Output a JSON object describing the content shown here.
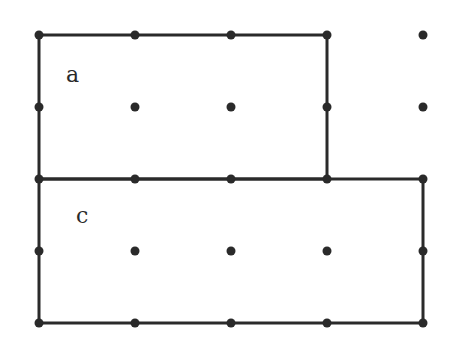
{
  "diagram": {
    "type": "dot-grid-rectangles",
    "grid": {
      "columns": 5,
      "rows": 5,
      "origin_px": [
        39,
        35
      ],
      "spacing_px": [
        96,
        72
      ],
      "dot_color": "#2a2a2a"
    },
    "shapes": [
      {
        "id": "a",
        "label": "a",
        "kind": "rectangle",
        "from": [
          0,
          0
        ],
        "to": [
          3,
          2
        ],
        "width_units": 3,
        "height_units": 2,
        "label_pos_px": [
          66,
          64
        ]
      },
      {
        "id": "c",
        "label": "c",
        "kind": "rectangle",
        "from": [
          0,
          2
        ],
        "to": [
          4,
          4
        ],
        "width_units": 4,
        "height_units": 2,
        "label_pos_px": [
          76,
          205
        ]
      }
    ],
    "stroke_color": "#2a2a2a",
    "stroke_width": 3
  }
}
